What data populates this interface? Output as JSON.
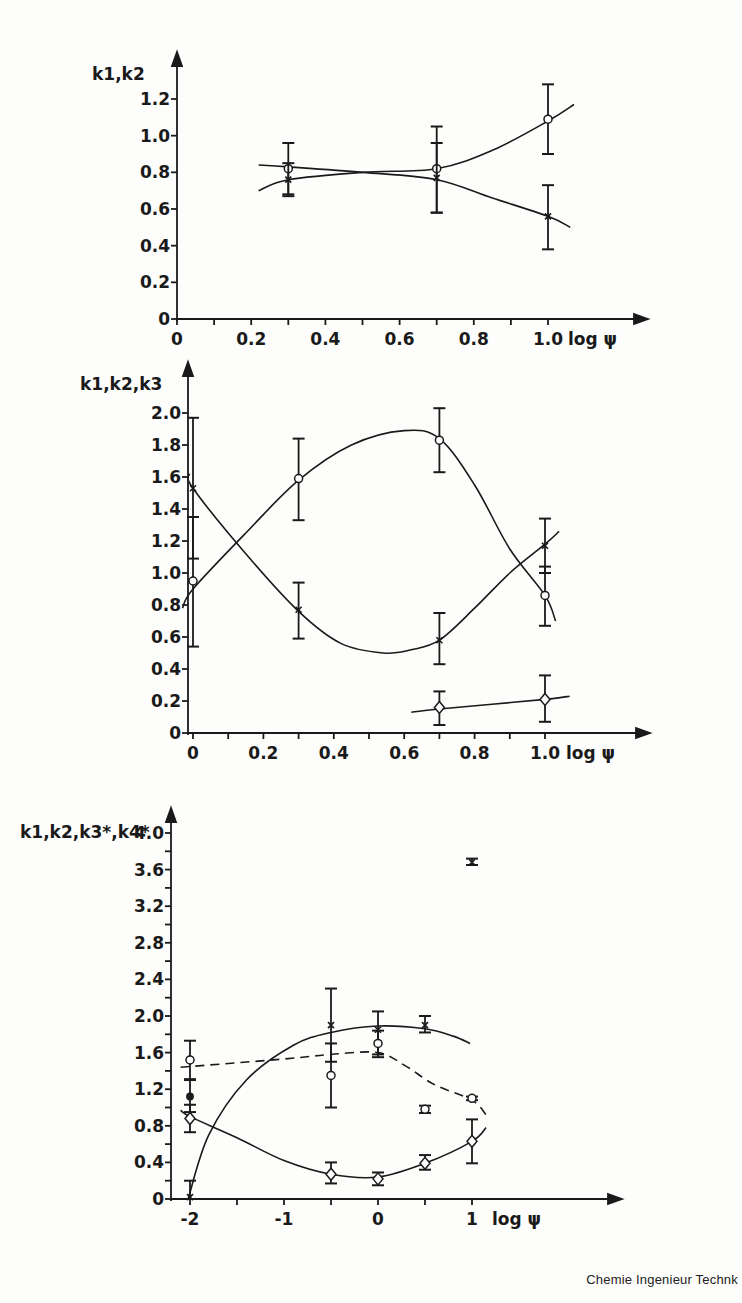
{
  "footer": {
    "journal": "Chemie Ingenieur Technk"
  },
  "chart_data": [
    {
      "type": "scatter",
      "title": "",
      "ylabel": "k1,k2",
      "xlabel": "log ψ",
      "xlim": [
        0,
        1.05
      ],
      "ylim": [
        0,
        1.2
      ],
      "xticks": [
        "0",
        "0.2",
        "0.4",
        "0.6",
        "0.8",
        "1.0"
      ],
      "yticks": [
        "0",
        "0.2",
        "0.4",
        "0.6",
        "0.8",
        "1.0",
        "1.2"
      ],
      "grid": false,
      "series": [
        {
          "name": "k1",
          "marker": "circle",
          "x": [
            0.3,
            0.7,
            1.0
          ],
          "y": [
            0.82,
            0.82,
            1.09
          ],
          "err_low": [
            0.68,
            0.58,
            0.9
          ],
          "err_high": [
            0.96,
            1.05,
            1.28
          ]
        },
        {
          "name": "k2",
          "marker": "cross",
          "x": [
            0.3,
            0.7,
            1.0
          ],
          "y": [
            0.76,
            0.77,
            0.56
          ],
          "err_low": [
            0.67,
            0.58,
            0.38
          ],
          "err_high": [
            0.85,
            0.96,
            0.73
          ]
        }
      ]
    },
    {
      "type": "scatter",
      "title": "",
      "ylabel": "k1,k2,k3",
      "xlabel": "log ψ",
      "xlim": [
        -0.05,
        1.05
      ],
      "ylim": [
        0,
        2.0
      ],
      "xticks": [
        "0",
        "0.2",
        "0.4",
        "0.6",
        "0.8",
        "1.0"
      ],
      "yticks": [
        "0",
        "0.2",
        "0.4",
        "0.6",
        "0.8",
        "1.0",
        "1.2",
        "1.4",
        "1.6",
        "1.8",
        "2.0"
      ],
      "grid": false,
      "series": [
        {
          "name": "k1",
          "marker": "circle",
          "x": [
            0,
            0.3,
            0.7,
            1.0
          ],
          "y": [
            0.95,
            1.59,
            1.83,
            0.86
          ],
          "err_low": [
            0.54,
            1.33,
            1.63,
            0.67
          ],
          "err_high": [
            1.35,
            1.84,
            2.03,
            1.04
          ]
        },
        {
          "name": "k2",
          "marker": "cross",
          "x": [
            0,
            0.3,
            0.7,
            1.0
          ],
          "y": [
            1.53,
            0.77,
            0.58,
            1.17
          ],
          "err_low": [
            1.09,
            0.59,
            0.43,
            1.0
          ],
          "err_high": [
            1.97,
            0.94,
            0.75,
            1.34
          ]
        },
        {
          "name": "k3",
          "marker": "diamond",
          "x": [
            0.7,
            1.0
          ],
          "y": [
            0.16,
            0.21
          ],
          "err_low": [
            0.05,
            0.07
          ],
          "err_high": [
            0.26,
            0.36
          ]
        }
      ]
    },
    {
      "type": "scatter",
      "title": "",
      "ylabel": "k1,k2,k3*,k4*",
      "xlabel": "log ψ",
      "xlim": [
        -2.1,
        1.6
      ],
      "ylim": [
        0,
        4.0
      ],
      "xticks": [
        "-2",
        "-1",
        "0",
        "1"
      ],
      "yticks": [
        "0",
        "0.4",
        "0.8",
        "1.2",
        "1.6",
        "2.0",
        "2.4",
        "2.8",
        "3.2",
        "3.6",
        "4.0"
      ],
      "grid": false,
      "series": [
        {
          "name": "k1",
          "marker": "cross",
          "line": "solid",
          "x": [
            -2,
            -0.5,
            0,
            0.5,
            1.0
          ],
          "y": [
            0.02,
            1.9,
            1.85,
            1.9,
            3.68
          ],
          "err_low": [
            0.0,
            1.5,
            1.55,
            1.82,
            3.65
          ],
          "err_high": [
            0.2,
            2.3,
            2.05,
            2.0,
            3.72
          ]
        },
        {
          "name": "k2",
          "marker": "circle",
          "line": "dashed",
          "x": [
            -2,
            -0.5,
            0,
            0.5,
            1.0
          ],
          "y": [
            1.52,
            1.35,
            1.7,
            0.98,
            1.1
          ],
          "err_low": [
            1.31,
            1.0,
            1.58,
            0.94,
            1.08
          ],
          "err_high": [
            1.73,
            1.7,
            1.84,
            1.02,
            1.12
          ]
        },
        {
          "name": "k3*",
          "marker": "asterisk",
          "x": [
            -2
          ],
          "y": [
            1.12
          ],
          "err_low": [
            0.95
          ],
          "err_high": [
            1.3
          ]
        },
        {
          "name": "k4*",
          "marker": "diamond",
          "line": "solid",
          "x": [
            -2,
            -0.5,
            0,
            0.5,
            1.0
          ],
          "y": [
            0.88,
            0.27,
            0.22,
            0.39,
            0.63
          ],
          "err_low": [
            0.73,
            0.17,
            0.15,
            0.32,
            0.39
          ],
          "err_high": [
            1.03,
            0.4,
            0.29,
            0.48,
            0.87
          ]
        }
      ]
    }
  ]
}
